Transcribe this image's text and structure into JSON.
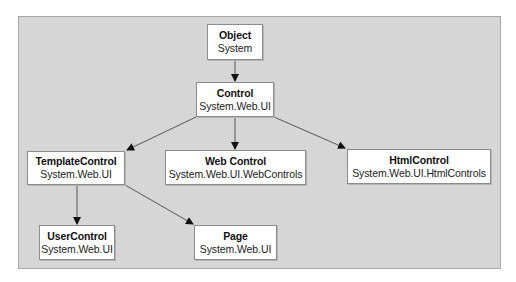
{
  "diagram": {
    "type": "class-hierarchy",
    "background_color": "#d6d6d6",
    "nodes": [
      {
        "id": "object",
        "name": "Object",
        "namespace": "System"
      },
      {
        "id": "control",
        "name": "Control",
        "namespace": "System.Web.UI"
      },
      {
        "id": "templatecontrol",
        "name": "TemplateControl",
        "namespace": "System.Web.UI"
      },
      {
        "id": "webcontrol",
        "name": "Web Control",
        "namespace": "System.Web.UI.WebControls"
      },
      {
        "id": "htmlcontrol",
        "name": "HtmlControl",
        "namespace": "System.Web.UI.HtmlControls"
      },
      {
        "id": "usercontrol",
        "name": "UserControl",
        "namespace": "System.Web.UI"
      },
      {
        "id": "page",
        "name": "Page",
        "namespace": "System.Web.UI"
      }
    ],
    "edges": [
      {
        "from": "object",
        "to": "control"
      },
      {
        "from": "control",
        "to": "templatecontrol"
      },
      {
        "from": "control",
        "to": "webcontrol"
      },
      {
        "from": "control",
        "to": "htmlcontrol"
      },
      {
        "from": "templatecontrol",
        "to": "usercontrol"
      },
      {
        "from": "templatecontrol",
        "to": "page"
      }
    ]
  }
}
